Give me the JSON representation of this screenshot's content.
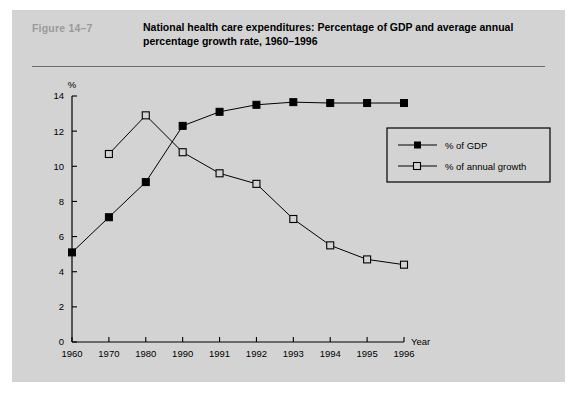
{
  "figure": {
    "number": "Figure  14–7",
    "title": "National health care expenditures: Percentage of GDP and average annual percentage growth rate, 1960–1996"
  },
  "chart_data": {
    "type": "line",
    "title": "National health care expenditures: Percentage of GDP and average annual percentage growth rate, 1960–1996",
    "xlabel": "Year",
    "ylabel": "%",
    "categories": [
      "1960",
      "1970",
      "1980",
      "1990",
      "1991",
      "1992",
      "1993",
      "1994",
      "1995",
      "1996"
    ],
    "ylim": [
      0,
      14
    ],
    "yticks": [
      0,
      2,
      4,
      6,
      8,
      10,
      12,
      14
    ],
    "ytick_labels": [
      "0",
      "2",
      "4",
      "6",
      "8",
      "10",
      "12",
      "14"
    ],
    "grid": false,
    "legend_position": "right-upper",
    "series": [
      {
        "name": "% of GDP",
        "marker": "filled-square",
        "color": "#000000",
        "values": [
          5.1,
          7.1,
          9.1,
          12.3,
          13.1,
          13.5,
          13.65,
          13.6,
          13.6,
          13.6
        ]
      },
      {
        "name": "% of annual growth",
        "marker": "open-square",
        "color": "#000000",
        "values": [
          null,
          10.7,
          12.9,
          10.8,
          9.6,
          9.0,
          7.0,
          5.5,
          4.7,
          4.4
        ]
      }
    ]
  },
  "axes": {
    "y_unit": "%",
    "x_label": "Year"
  },
  "legend": {
    "items": [
      {
        "label": "% of GDP",
        "marker": "filled-square"
      },
      {
        "label": "% of annual growth",
        "marker": "open-square"
      }
    ]
  }
}
